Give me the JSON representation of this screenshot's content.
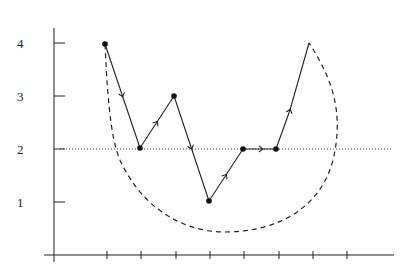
{
  "diagram": {
    "type": "path-diagram",
    "y_axis": {
      "ticks": [
        {
          "label": "4",
          "value": 4,
          "y": 43
        },
        {
          "label": "3",
          "value": 3,
          "y": 96
        },
        {
          "label": "2",
          "value": 2,
          "y": 149
        },
        {
          "label": "1",
          "value": 1,
          "y": 202
        }
      ]
    },
    "x_axis": {
      "tick_positions": [
        107,
        141,
        176,
        210,
        244,
        279,
        313,
        347
      ],
      "tick_labels": []
    },
    "reference_line": {
      "style": "dotted",
      "value": 2
    },
    "path_points": [
      {
        "step": 0,
        "value": 4,
        "marker": true
      },
      {
        "step": 1,
        "value": 2,
        "marker": true
      },
      {
        "step": 2,
        "value": 3,
        "marker": true
      },
      {
        "step": 3,
        "value": 1,
        "marker": true
      },
      {
        "step": 4,
        "value": 2,
        "marker": true
      },
      {
        "step": 5,
        "value": 2,
        "marker": true
      },
      {
        "step": 6,
        "value": 4,
        "marker": false
      }
    ],
    "envelope": {
      "style": "dashed",
      "description": "closed dashed curve from start to end point enclosing the path from below"
    },
    "colors": {
      "line": "#222222",
      "background": "#ffffff"
    }
  }
}
